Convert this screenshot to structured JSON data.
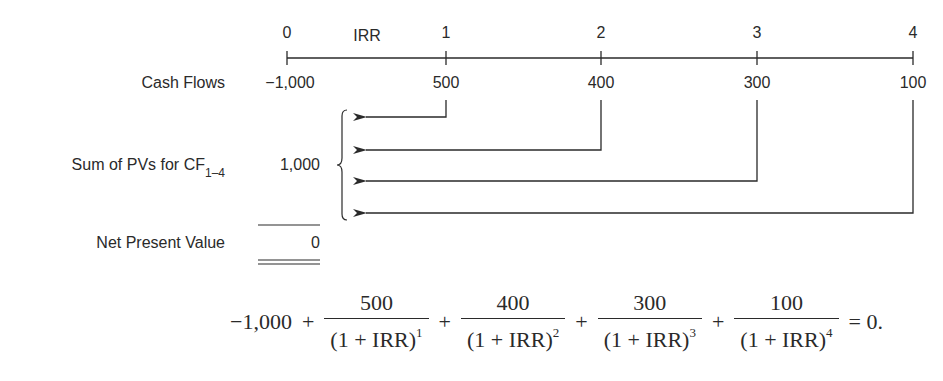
{
  "timeline": {
    "rate_label": "IRR",
    "periods": [
      "0",
      "1",
      "2",
      "3",
      "4"
    ]
  },
  "rows": {
    "cash_flows_label": "Cash Flows",
    "cash_flows": [
      "−1,000",
      "500",
      "400",
      "300",
      "100"
    ],
    "sum_label_main": "Sum of PVs for CF",
    "sum_label_sub": "1–4",
    "sum_value": "1,000",
    "npv_label": "Net Present Value",
    "npv_value": "0"
  },
  "formula": {
    "initial": "−1,000",
    "plus": "+",
    "terms": [
      {
        "numerator": "500",
        "denominator": "(1 + IRR)",
        "exponent": "1"
      },
      {
        "numerator": "400",
        "denominator": "(1 + IRR)",
        "exponent": "2"
      },
      {
        "numerator": "300",
        "denominator": "(1 + IRR)",
        "exponent": "3"
      },
      {
        "numerator": "100",
        "denominator": "(1 + IRR)",
        "exponent": "4"
      }
    ],
    "equals": "= 0."
  },
  "colors": {
    "ink": "#2a2a2a",
    "background": "#ffffff"
  }
}
